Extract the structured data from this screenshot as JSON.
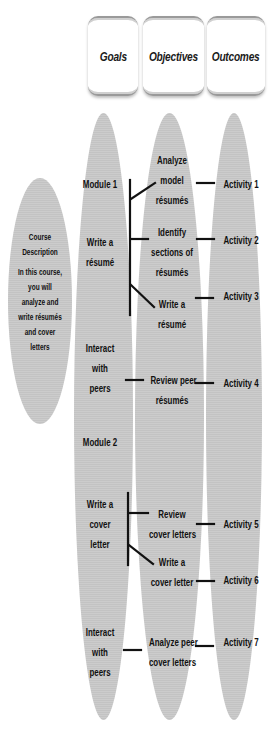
{
  "headers": {
    "goals": "Goals",
    "objectives": "Objectives",
    "outcomes": "Outcomes"
  },
  "course": {
    "title_1": "Course",
    "title_2": "Description",
    "desc_lines": [
      "In this course,",
      "you will",
      "analyze and",
      "write résumés",
      "and cover",
      "letters"
    ]
  },
  "goals": {
    "module1": "Module 1",
    "write_resume": [
      "Write a",
      "résumé"
    ],
    "interact1": [
      "Interact",
      "with",
      "peers"
    ],
    "module2": "Module 2",
    "write_cover": [
      "Write a",
      "cover",
      "letter"
    ],
    "interact2": [
      "Interact",
      "with",
      "peers"
    ]
  },
  "objectives": {
    "analyze_model": [
      "Analyze",
      "model",
      "résumés"
    ],
    "identify_sections": [
      "Identify",
      "sections of",
      "résumés"
    ],
    "write_resume": [
      "Write a",
      "résumé"
    ],
    "review_peer": [
      "Review peer",
      "résumés"
    ],
    "review_cover": [
      "Review",
      "cover letters"
    ],
    "write_cover": [
      "Write a",
      "cover letter"
    ],
    "analyze_peer": [
      "Analyze peer",
      "cover letters"
    ]
  },
  "outcomes": {
    "a1": "Activity 1",
    "a2": "Activity 2",
    "a3": "Activity 3",
    "a4": "Activity 4",
    "a5": "Activity 5",
    "a6": "Activity 6",
    "a7": "Activity 7"
  },
  "colors": {
    "ellipse_fill": "#c9c9c9",
    "text": "#111111",
    "connector": "#111111"
  }
}
